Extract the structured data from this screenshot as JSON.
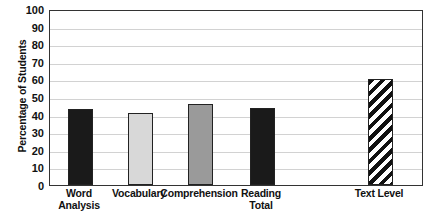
{
  "chart_data": {
    "type": "bar",
    "title": "",
    "xlabel": "",
    "ylabel": "Percentage of Students",
    "ylim": [
      0,
      100
    ],
    "ytick_step": 10,
    "grid": true,
    "legend": "none",
    "categories": [
      "Word Analysis",
      "Vocabulary",
      "Comprehension",
      "Reading Total",
      "Text Level"
    ],
    "values": [
      43,
      41,
      46,
      44,
      60
    ],
    "ytick_labels": [
      "100",
      "90",
      "80",
      "70",
      "60",
      "50",
      "40",
      "30",
      "20",
      "10",
      "0"
    ],
    "bars": [
      {
        "label_line1": "Word",
        "label_line2": "Analysis",
        "value": 43,
        "fill": "black",
        "color": "#1a1a1a"
      },
      {
        "label_line1": "Vocabulary",
        "label_line2": "",
        "value": 41,
        "fill": "light-gray",
        "color": "#d8d8d8"
      },
      {
        "label_line1": "Comprehension",
        "label_line2": "",
        "value": 46,
        "fill": "medium-gray",
        "color": "#9a9a9a"
      },
      {
        "label_line1": "Reading",
        "label_line2": "Total",
        "value": 44,
        "fill": "black",
        "color": "#1a1a1a"
      },
      {
        "label_line1": "Text Level",
        "label_line2": "",
        "value": 60,
        "fill": "diagonal-hatch",
        "color": "#111111"
      }
    ]
  }
}
